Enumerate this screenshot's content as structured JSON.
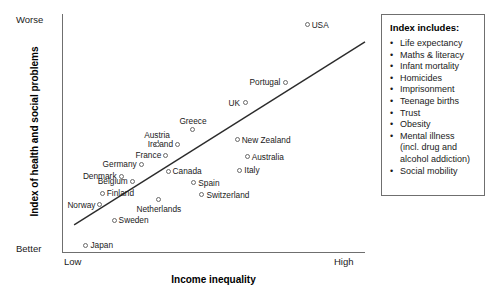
{
  "chart_data": {
    "type": "scatter",
    "title": "",
    "xlabel": "Income inequality",
    "ylabel": "Index of health and social problems",
    "x_tick_labels": [
      "Low",
      "High"
    ],
    "y_tick_labels": [
      "Worse",
      "Better"
    ],
    "grid": false,
    "xlim": [
      0,
      100
    ],
    "ylim": [
      0,
      100
    ],
    "y_axis_direction": "worse-at-top",
    "trendline": {
      "x1": 4.0,
      "y1": 11.8,
      "x2": 100.0,
      "y2": 88.3,
      "visible": true
    },
    "points": [
      {
        "label": "USA",
        "x": 80.9,
        "y": 95.4,
        "label_pos": "right"
      },
      {
        "label": "Portugal",
        "x": 73.6,
        "y": 71.5,
        "label_pos": "left"
      },
      {
        "label": "UK",
        "x": 60.4,
        "y": 62.8,
        "label_pos": "left"
      },
      {
        "label": "New Zealand",
        "x": 57.8,
        "y": 47.3,
        "label_pos": "right"
      },
      {
        "label": "Greece",
        "x": 43.2,
        "y": 51.5,
        "label_pos": "above"
      },
      {
        "label": "Ireland",
        "x": 38.0,
        "y": 45.6,
        "label_pos": "left"
      },
      {
        "label": "France",
        "x": 34.3,
        "y": 41.0,
        "label_pos": "left"
      },
      {
        "label": "Austria",
        "x": 31.4,
        "y": 45.6,
        "label_pos": "above"
      },
      {
        "label": "Australia",
        "x": 61.1,
        "y": 40.2,
        "label_pos": "right"
      },
      {
        "label": "Italy",
        "x": 58.7,
        "y": 34.7,
        "label_pos": "right"
      },
      {
        "label": "Canada",
        "x": 35.0,
        "y": 34.3,
        "label_pos": "right"
      },
      {
        "label": "Germany",
        "x": 26.1,
        "y": 37.2,
        "label_pos": "left"
      },
      {
        "label": "Denmark",
        "x": 19.6,
        "y": 32.2,
        "label_pos": "left"
      },
      {
        "label": "Belgium",
        "x": 23.2,
        "y": 30.1,
        "label_pos": "left"
      },
      {
        "label": "Spain",
        "x": 43.5,
        "y": 29.3,
        "label_pos": "right"
      },
      {
        "label": "Switzerland",
        "x": 46.2,
        "y": 24.3,
        "label_pos": "right"
      },
      {
        "label": "Finland",
        "x": 13.3,
        "y": 25.1,
        "label_pos": "right"
      },
      {
        "label": "Netherlands",
        "x": 32.0,
        "y": 22.2,
        "label_pos": "below"
      },
      {
        "label": "Norway",
        "x": 12.5,
        "y": 20.1,
        "label_pos": "left"
      },
      {
        "label": "Sweden",
        "x": 17.2,
        "y": 13.8,
        "label_pos": "right"
      },
      {
        "label": "Japan",
        "x": 7.9,
        "y": 3.3,
        "label_pos": "right"
      }
    ]
  },
  "legend": {
    "title": "Index includes:",
    "items": [
      {
        "text": "Life expectancy",
        "continuation": false
      },
      {
        "text": "Maths & literacy",
        "continuation": false
      },
      {
        "text": "Infant mortality",
        "continuation": false
      },
      {
        "text": "Homicides",
        "continuation": false
      },
      {
        "text": "Imprisonment",
        "continuation": false
      },
      {
        "text": "Teenage births",
        "continuation": false
      },
      {
        "text": "Trust",
        "continuation": false
      },
      {
        "text": "Obesity",
        "continuation": false
      },
      {
        "text": "Mental illness",
        "continuation": false
      },
      {
        "text": "(incl. drug and",
        "continuation": true
      },
      {
        "text": "alcohol addiction)",
        "continuation": true
      },
      {
        "text": "Social mobility",
        "continuation": false
      }
    ]
  },
  "colors": {
    "axis": "#6f6f6f",
    "marker_outline": "#6a6a6a",
    "trendline": "#2b2b2b",
    "text": "#1a1a1a"
  }
}
